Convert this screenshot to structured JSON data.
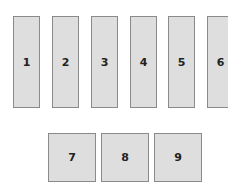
{
  "top_row": [
    {
      "label": "1",
      "x": 13
    },
    {
      "label": "2",
      "x": 52
    },
    {
      "label": "3",
      "x": 91
    },
    {
      "label": "4",
      "x": 130
    },
    {
      "label": "5",
      "x": 168
    },
    {
      "label": "6",
      "x": 207
    }
  ],
  "bottom_row": [
    {
      "label": "7",
      "x": 48
    },
    {
      "label": "8",
      "x": 101
    },
    {
      "label": "9",
      "x": 154
    }
  ],
  "colors": {
    "fill": "#dedede",
    "border": "#8a8a8a",
    "text": "#222222"
  }
}
